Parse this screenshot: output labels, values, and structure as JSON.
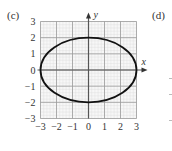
{
  "panels": {
    "left_label": "(c)",
    "right_label": "(d)"
  },
  "chart_data": {
    "type": "line",
    "title": "",
    "subtitle": "",
    "equation": "x^2/9 + y^2/4 = 1",
    "xlabel": "x",
    "ylabel": "y",
    "xlim": [
      -3,
      3
    ],
    "ylim": [
      -3,
      3
    ],
    "xticks": [
      "-3",
      "-2",
      "-1",
      "0",
      "1",
      "2",
      "3"
    ],
    "yticks": [
      "3",
      "2",
      "1",
      "0",
      "-1",
      "-2",
      "-3"
    ],
    "grid": true,
    "minor_grid": true,
    "legend": null,
    "series": [
      {
        "name": "ellipse",
        "center": [
          0,
          0
        ],
        "semi_axis_x": 3,
        "semi_axis_y": 2,
        "key_points": [
          [
            -3,
            0
          ],
          [
            0,
            2
          ],
          [
            3,
            0
          ],
          [
            0,
            -2
          ]
        ],
        "color": "#111111"
      }
    ]
  },
  "colors": {
    "major_grid": "#9a9a9a",
    "minor_grid": "#dcdcdc",
    "axis": "#555555",
    "curve": "#111111"
  }
}
